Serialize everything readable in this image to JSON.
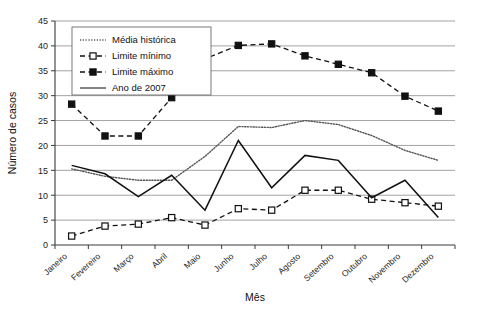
{
  "chart_data": {
    "type": "line",
    "title": "",
    "xlabel": "Mês",
    "ylabel": "Número de casos",
    "categories": [
      "Janeiro",
      "Fevereiro",
      "Março",
      "Abril",
      "Maio",
      "Junho",
      "Julho",
      "Agosto",
      "Setembro",
      "Outubro",
      "Novembro",
      "Dezembro"
    ],
    "ylim": [
      0,
      45
    ],
    "yticks": [
      0,
      5,
      10,
      15,
      20,
      25,
      30,
      35,
      40,
      45
    ],
    "grid": true,
    "legend_position": "top-left-inside",
    "series": [
      {
        "name": "Média histórica",
        "style": "dotted",
        "marker": "none",
        "color": "#555555",
        "values": [
          15.3,
          13.8,
          13.0,
          13.0,
          17.8,
          23.8,
          23.6,
          25.0,
          24.2,
          22.0,
          19.0,
          17.0
        ]
      },
      {
        "name": "Limite mínimo",
        "style": "dashed",
        "marker": "open-square",
        "color": "#111111",
        "values": [
          1.8,
          3.8,
          4.2,
          5.5,
          4.0,
          7.3,
          7.0,
          11.0,
          11.0,
          9.2,
          8.5,
          7.8
        ]
      },
      {
        "name": "Limite máximo",
        "style": "dashed",
        "marker": "filled-square",
        "color": "#111111",
        "values": [
          28.3,
          21.9,
          21.9,
          29.6,
          37.4,
          40.1,
          40.4,
          38.0,
          36.3,
          34.6,
          29.9,
          26.9
        ]
      },
      {
        "name": "Ano de 2007",
        "style": "solid",
        "marker": "none",
        "color": "#111111",
        "values": [
          16.0,
          14.3,
          9.7,
          14.0,
          7.0,
          21.0,
          11.5,
          18.0,
          17.0,
          9.5,
          13.0,
          5.5
        ]
      }
    ]
  },
  "legend": {
    "entries": [
      {
        "label": "Média histórica"
      },
      {
        "label": "Limite mínimo"
      },
      {
        "label": "Limite máximo"
      },
      {
        "label": "Ano de 2007"
      }
    ]
  },
  "axes": {
    "y_title": "Número de casos",
    "x_title": "Mês",
    "y_tick_labels": [
      "0",
      "5",
      "10",
      "15",
      "20",
      "25",
      "30",
      "35",
      "40",
      "45"
    ],
    "x_tick_labels": [
      "Janeiro",
      "Fevereiro",
      "Março",
      "Abril",
      "Maio",
      "Junho",
      "Julho",
      "Agosto",
      "Setembro",
      "Outubro",
      "Novembro",
      "Dezembro"
    ]
  }
}
